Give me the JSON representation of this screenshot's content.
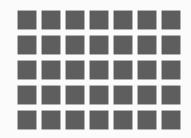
{
  "grid": {
    "rows": 5,
    "columns": 7,
    "tile_color": "#5e5e5e",
    "background_color": "#fbfbfb"
  }
}
